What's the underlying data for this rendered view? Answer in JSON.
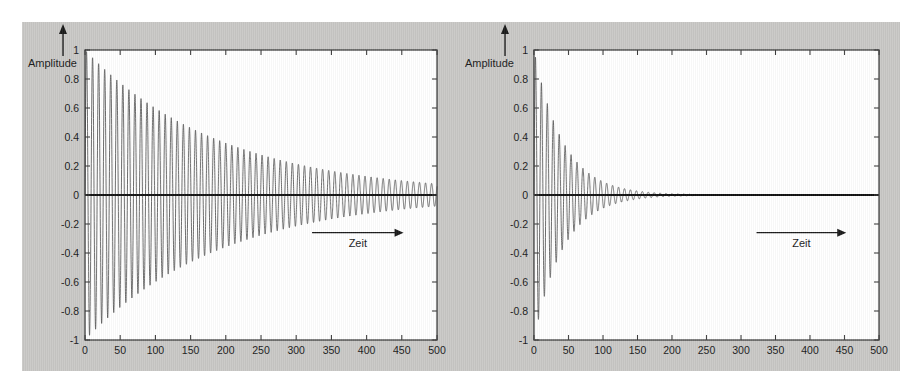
{
  "figure": {
    "background_color": "#c9c8c6",
    "plot_background_color": "#ffffff",
    "axis_color": "#3c3c3c",
    "curve_color": "#555555",
    "zero_line_color": "#111111"
  },
  "charts": [
    {
      "id": "left",
      "chart_data": {
        "type": "line",
        "title": "",
        "xlabel": "Zeit",
        "ylabel": "Amplitude",
        "xlim": [
          0,
          500
        ],
        "ylim": [
          -1,
          1
        ],
        "grid": false,
        "legend": null,
        "xticks": [
          0,
          50,
          100,
          150,
          200,
          250,
          300,
          350,
          400,
          450,
          500
        ],
        "xticklabels": [
          "0",
          "50",
          "100",
          "150",
          "200",
          "250",
          "300",
          "350",
          "400",
          "450",
          "500"
        ],
        "yticks": [
          -1,
          -0.8,
          -0.6,
          -0.4,
          -0.2,
          0,
          0.2,
          0.4,
          0.6,
          0.8,
          1
        ],
        "yticklabels": [
          "-1",
          "-0.8",
          "-0.6",
          "-0.4",
          "-0.2",
          "0",
          "0.2",
          "0.4",
          "0.6",
          "0.8",
          "1"
        ],
        "annotations": [
          {
            "name": "amplitude-axis-arrow",
            "text": "Amplitude",
            "direction": "up"
          },
          {
            "name": "zeit-axis-arrow",
            "text": "Zeit",
            "direction": "right"
          }
        ],
        "series": [
          {
            "name": "weakly damped oscillation",
            "model": "damped_sine",
            "amplitude": 1.0,
            "period": 8.6,
            "decay_tau": 195,
            "phase_deg": 0,
            "x_start": 0,
            "x_end": 500,
            "envelope_at_x": [
              {
                "x": 0,
                "amp": 1.0
              },
              {
                "x": 50,
                "amp": 0.78
              },
              {
                "x": 100,
                "amp": 0.6
              },
              {
                "x": 150,
                "amp": 0.47
              },
              {
                "x": 200,
                "amp": 0.36
              },
              {
                "x": 250,
                "amp": 0.28
              },
              {
                "x": 300,
                "amp": 0.22
              },
              {
                "x": 350,
                "amp": 0.17
              },
              {
                "x": 400,
                "amp": 0.13
              },
              {
                "x": 450,
                "amp": 0.1
              },
              {
                "x": 500,
                "amp": 0.08
              }
            ]
          },
          {
            "name": "zero baseline",
            "model": "constant",
            "value": 0
          }
        ]
      }
    },
    {
      "id": "right",
      "chart_data": {
        "type": "line",
        "title": "",
        "xlabel": "Zeit",
        "ylabel": "Amplitude",
        "xlim": [
          0,
          500
        ],
        "ylim": [
          -1,
          1
        ],
        "grid": false,
        "legend": null,
        "xticks": [
          0,
          50,
          100,
          150,
          200,
          250,
          300,
          350,
          400,
          450,
          500
        ],
        "xticklabels": [
          "0",
          "50",
          "100",
          "150",
          "200",
          "250",
          "300",
          "350",
          "400",
          "450",
          "500"
        ],
        "yticks": [
          -1,
          -0.8,
          -0.6,
          -0.4,
          -0.2,
          0,
          0.2,
          0.4,
          0.6,
          0.8,
          1
        ],
        "yticklabels": [
          "-1",
          "-0.8",
          "-0.6",
          "-0.4",
          "-0.2",
          "0",
          "0.2",
          "0.4",
          "0.6",
          "0.8",
          "1"
        ],
        "annotations": [
          {
            "name": "amplitude-axis-arrow",
            "text": "Amplitude",
            "direction": "up"
          },
          {
            "name": "zeit-axis-arrow",
            "text": "Zeit",
            "direction": "right"
          }
        ],
        "series": [
          {
            "name": "strongly damped oscillation",
            "model": "damped_sine",
            "amplitude": 1.0,
            "period": 8.6,
            "decay_tau": 42,
            "phase_deg": 0,
            "x_start": 0,
            "x_end": 500,
            "envelope_at_x": [
              {
                "x": 0,
                "amp": 1.0
              },
              {
                "x": 25,
                "amp": 0.55
              },
              {
                "x": 50,
                "amp": 0.3
              },
              {
                "x": 75,
                "amp": 0.17
              },
              {
                "x": 100,
                "amp": 0.09
              },
              {
                "x": 125,
                "amp": 0.05
              },
              {
                "x": 150,
                "amp": 0.03
              },
              {
                "x": 175,
                "amp": 0.016
              },
              {
                "x": 200,
                "amp": 0.009
              },
              {
                "x": 250,
                "amp": 0.003
              },
              {
                "x": 300,
                "amp": 0.0
              },
              {
                "x": 400,
                "amp": 0.0
              },
              {
                "x": 500,
                "amp": 0.0
              }
            ]
          },
          {
            "name": "zero baseline",
            "model": "constant",
            "value": 0
          }
        ]
      }
    }
  ]
}
